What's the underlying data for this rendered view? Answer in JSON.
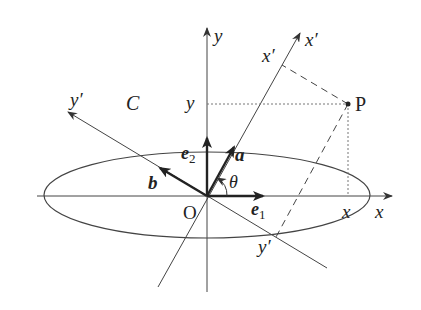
{
  "diagram": {
    "labels": {
      "y_axis": "y",
      "x_axis": "x",
      "x_prime_axis": "x′",
      "y_prime_axis": "y′",
      "curve": "C",
      "origin": "O",
      "point": "P",
      "e1": "e",
      "e1_sub": "1",
      "e2": "e",
      "e2_sub": "2",
      "vec_a": "a",
      "vec_b": "b",
      "angle": "θ",
      "P_x": "x",
      "P_y": "y",
      "P_xprime": "x′",
      "P_yprime": "y′"
    },
    "colors": {
      "line": "#333333",
      "text": "#222222"
    }
  }
}
